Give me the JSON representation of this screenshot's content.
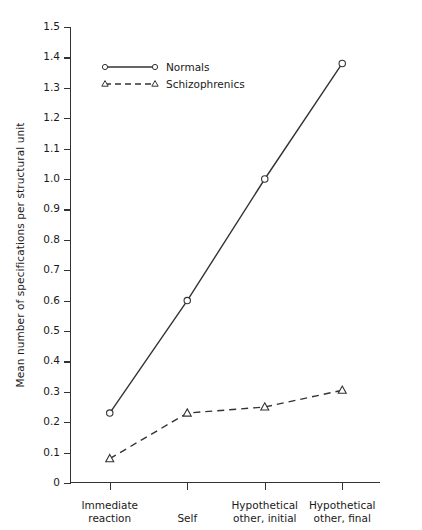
{
  "chart_data": {
    "type": "line",
    "title": "",
    "xlabel": "",
    "ylabel": "Mean number of specifications per structural unit",
    "categories": [
      "Immediate\nreaction",
      "Self",
      "Hypothetical\nother, initial",
      "Hypothetical\nother, final"
    ],
    "category_lines": [
      [
        "Immediate",
        "reaction"
      ],
      [
        "Self",
        ""
      ],
      [
        "Hypothetical",
        "other, initial"
      ],
      [
        "Hypothetical",
        "other, final"
      ]
    ],
    "series": [
      {
        "name": "Normals",
        "marker": "circle",
        "linestyle": "solid",
        "values": [
          0.23,
          0.6,
          1.0,
          1.38
        ]
      },
      {
        "name": "Schizophrenics",
        "marker": "triangle",
        "linestyle": "dashed",
        "values": [
          0.08,
          0.23,
          0.25,
          0.305
        ]
      }
    ],
    "ylim": [
      0,
      1.5
    ],
    "yticks": [
      "0",
      "0.1",
      "0.2",
      "0.3",
      "0.4",
      "0.5",
      "0.6",
      "0.7",
      "0.8",
      "0.9",
      "1.0",
      "1.1",
      "1.2",
      "1.3",
      "1.4",
      "1.5"
    ],
    "ytick_values": [
      0,
      0.1,
      0.2,
      0.3,
      0.4,
      0.5,
      0.6,
      0.7,
      0.8,
      0.9,
      1.0,
      1.1,
      1.2,
      1.3,
      1.4,
      1.5
    ],
    "grid": false,
    "legend_position": "upper-left-inside",
    "line_color": "#333333"
  }
}
